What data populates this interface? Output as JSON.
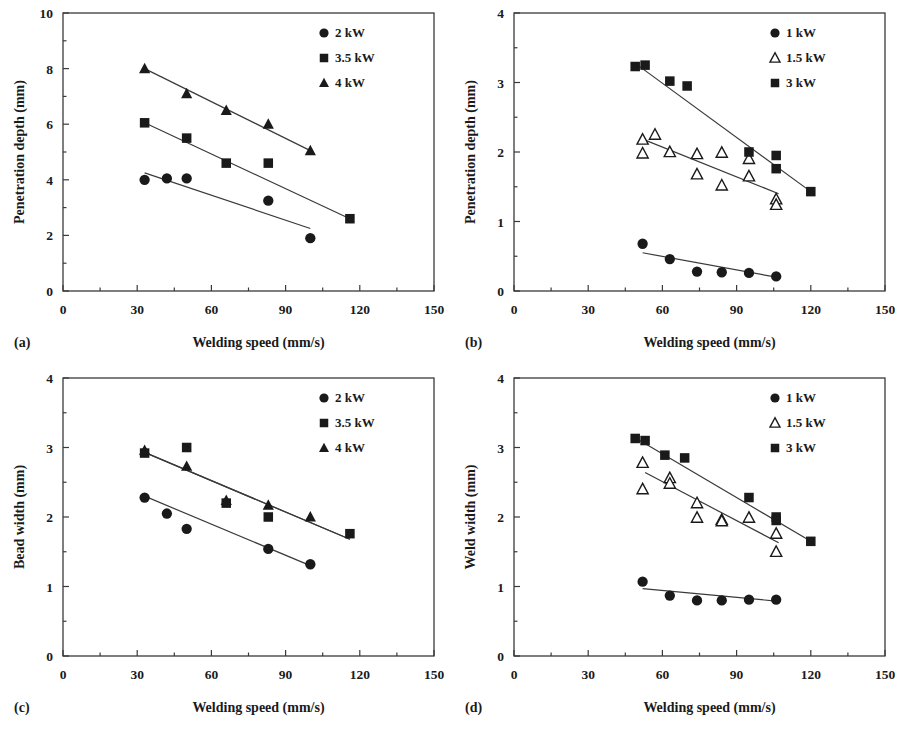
{
  "figure": {
    "background": "#ffffff",
    "ink_color": "#1a1a1a",
    "panel_count": 4
  },
  "common": {
    "xlabel": "Welding speed (mm/s)",
    "xticks": [
      "0",
      "30",
      "60",
      "90",
      "120",
      "150"
    ],
    "xlim": [
      0,
      150
    ],
    "unit_note": "mm"
  },
  "panels": [
    {
      "letter": "(a)",
      "ylabel": "Penetration depth (mm)",
      "yticks": [
        "0",
        "2",
        "4",
        "6",
        "8",
        "10"
      ],
      "legend": [
        {
          "label": "2 kW",
          "marker": "filled-circle"
        },
        {
          "label": "3.5 kW",
          "marker": "filled-square"
        },
        {
          "label": "4 kW",
          "marker": "filled-triangle"
        }
      ]
    },
    {
      "letter": "(b)",
      "ylabel": "Penetration depth (mm)",
      "yticks": [
        "0",
        "1",
        "2",
        "3",
        "4"
      ],
      "legend": [
        {
          "label": "1 kW",
          "marker": "filled-circle"
        },
        {
          "label": "1.5 kW",
          "marker": "open-triangle"
        },
        {
          "label": "3 kW",
          "marker": "filled-square"
        }
      ]
    },
    {
      "letter": "(c)",
      "ylabel": "Bead width (mm)",
      "yticks": [
        "0",
        "1",
        "2",
        "3",
        "4"
      ],
      "legend": [
        {
          "label": "2 kW",
          "marker": "filled-circle"
        },
        {
          "label": "3.5 kW",
          "marker": "filled-square"
        },
        {
          "label": "4 kW",
          "marker": "filled-triangle"
        }
      ]
    },
    {
      "letter": "(d)",
      "ylabel": "Weld width (mm)",
      "yticks": [
        "0",
        "1",
        "2",
        "3",
        "4"
      ],
      "legend": [
        {
          "label": "1 kW",
          "marker": "filled-circle"
        },
        {
          "label": "1.5 kW",
          "marker": "open-triangle"
        },
        {
          "label": "3 kW",
          "marker": "filled-square"
        }
      ]
    }
  ],
  "chart_data": [
    {
      "type": "scatter",
      "panel": "(a)",
      "title": "",
      "xlabel": "Welding speed (mm/s)",
      "ylabel": "Penetration depth (mm)",
      "xlim": [
        0,
        150
      ],
      "ylim": [
        0,
        10
      ],
      "xticks": [
        0,
        30,
        60,
        90,
        120,
        150
      ],
      "yticks": [
        0,
        2,
        4,
        6,
        8,
        10
      ],
      "grid": false,
      "legend_position": "top-right",
      "series": [
        {
          "name": "2 kW",
          "marker": "filled-circle",
          "x": [
            33,
            42,
            50,
            83,
            100
          ],
          "y": [
            4.0,
            4.05,
            4.05,
            3.25,
            1.9
          ],
          "fit_line": {
            "x": [
              33,
              100
            ],
            "y": [
              4.25,
              2.25
            ]
          }
        },
        {
          "name": "3.5 kW",
          "marker": "filled-square",
          "x": [
            33,
            50,
            66,
            83,
            116
          ],
          "y": [
            6.05,
            5.5,
            4.6,
            4.6,
            2.6
          ],
          "fit_line": {
            "x": [
              33,
              116
            ],
            "y": [
              6.05,
              2.6
            ]
          }
        },
        {
          "name": "4 kW",
          "marker": "filled-triangle",
          "x": [
            33,
            50,
            66,
            83,
            100
          ],
          "y": [
            8.0,
            7.1,
            6.5,
            6.0,
            5.05
          ],
          "fit_line": {
            "x": [
              33,
              100
            ],
            "y": [
              8.0,
              5.05
            ]
          }
        }
      ]
    },
    {
      "type": "scatter",
      "panel": "(b)",
      "title": "",
      "xlabel": "Welding speed (mm/s)",
      "ylabel": "Penetration depth (mm)",
      "xlim": [
        0,
        150
      ],
      "ylim": [
        0,
        4
      ],
      "xticks": [
        0,
        30,
        60,
        90,
        120,
        150
      ],
      "yticks": [
        0,
        1,
        2,
        3,
        4
      ],
      "grid": false,
      "legend_position": "top-right",
      "series": [
        {
          "name": "1 kW",
          "marker": "filled-circle",
          "x": [
            52,
            63,
            74,
            84,
            95,
            106
          ],
          "y": [
            0.68,
            0.46,
            0.28,
            0.27,
            0.26,
            0.21
          ],
          "fit_line": {
            "x": [
              52,
              106
            ],
            "y": [
              0.55,
              0.2
            ]
          }
        },
        {
          "name": "1.5 kW",
          "marker": "open-triangle",
          "x": [
            52,
            52,
            57,
            63,
            74,
            74,
            84,
            84,
            95,
            95,
            106,
            106
          ],
          "y": [
            2.18,
            1.98,
            2.25,
            2.0,
            1.97,
            1.68,
            1.99,
            1.52,
            1.9,
            1.65,
            1.32,
            1.24
          ],
          "fit_line": {
            "x": [
              51,
              107
            ],
            "y": [
              2.2,
              1.4
            ]
          }
        },
        {
          "name": "3 kW",
          "marker": "filled-square",
          "x": [
            49,
            53,
            63,
            70,
            95,
            106,
            106,
            120
          ],
          "y": [
            3.23,
            3.25,
            3.02,
            2.95,
            2.0,
            1.95,
            1.76,
            1.43
          ],
          "fit_line": {
            "x": [
              50,
              120
            ],
            "y": [
              3.25,
              1.43
            ]
          }
        }
      ]
    },
    {
      "type": "scatter",
      "panel": "(c)",
      "title": "",
      "xlabel": "Welding speed (mm/s)",
      "ylabel": "Bead width (mm)",
      "xlim": [
        0,
        150
      ],
      "ylim": [
        0,
        4
      ],
      "xticks": [
        0,
        30,
        60,
        90,
        120,
        150
      ],
      "yticks": [
        0,
        1,
        2,
        3,
        4
      ],
      "grid": false,
      "legend_position": "top-right",
      "series": [
        {
          "name": "2 kW",
          "marker": "filled-circle",
          "x": [
            33,
            42,
            50,
            83,
            100
          ],
          "y": [
            2.28,
            2.05,
            1.83,
            1.54,
            1.32
          ],
          "fit_line": {
            "x": [
              33,
              100
            ],
            "y": [
              2.3,
              1.3
            ]
          }
        },
        {
          "name": "3.5 kW",
          "marker": "filled-square",
          "x": [
            33,
            50,
            66,
            83,
            116
          ],
          "y": [
            2.92,
            3.0,
            2.2,
            2.0,
            1.76
          ],
          "fit_line": {
            "x": [
              33,
              116
            ],
            "y": [
              2.93,
              1.68
            ]
          }
        },
        {
          "name": "4 kW",
          "marker": "filled-triangle",
          "x": [
            33,
            50,
            66,
            83,
            100
          ],
          "y": [
            2.96,
            2.73,
            2.24,
            2.17,
            2.0
          ],
          "fit_line": {
            "x": [
              33,
              116
            ],
            "y": [
              2.93,
              1.68
            ]
          }
        }
      ]
    },
    {
      "type": "scatter",
      "panel": "(d)",
      "title": "",
      "xlabel": "Welding speed (mm/s)",
      "ylabel": "Weld width (mm)",
      "xlim": [
        0,
        150
      ],
      "ylim": [
        0,
        4
      ],
      "xticks": [
        0,
        30,
        60,
        90,
        120,
        150
      ],
      "yticks": [
        0,
        1,
        2,
        3,
        4
      ],
      "grid": false,
      "legend_position": "top-right",
      "series": [
        {
          "name": "1 kW",
          "marker": "filled-circle",
          "x": [
            52,
            63,
            74,
            84,
            95,
            106
          ],
          "y": [
            1.07,
            0.87,
            0.8,
            0.8,
            0.81,
            0.81
          ],
          "fit_line": {
            "x": [
              52,
              106
            ],
            "y": [
              0.97,
              0.79
            ]
          }
        },
        {
          "name": "1.5 kW",
          "marker": "open-triangle",
          "x": [
            52,
            52,
            63,
            63,
            74,
            74,
            84,
            84,
            95,
            106,
            106
          ],
          "y": [
            2.78,
            2.4,
            2.56,
            2.48,
            2.2,
            1.99,
            1.96,
            1.94,
            1.99,
            1.76,
            1.5
          ],
          "fit_line": {
            "x": [
              53,
              107
            ],
            "y": [
              2.64,
              1.63
            ]
          }
        },
        {
          "name": "3 kW",
          "marker": "filled-square",
          "x": [
            49,
            53,
            61,
            69,
            95,
            106,
            106,
            120
          ],
          "y": [
            3.13,
            3.1,
            2.89,
            2.85,
            2.28,
            2.0,
            1.95,
            1.65
          ],
          "fit_line": {
            "x": [
              50,
              120
            ],
            "y": [
              3.12,
              1.65
            ]
          }
        }
      ]
    }
  ]
}
